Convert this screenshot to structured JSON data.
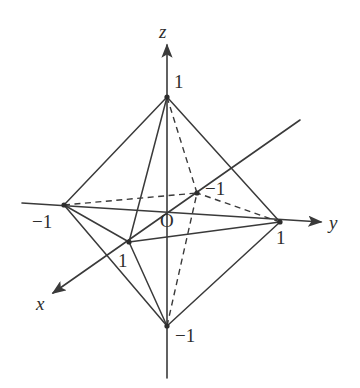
{
  "figure": {
    "background_color": "#ffffff",
    "line_color": "#3a3a3a",
    "text_color": "#2d2d2d"
  },
  "axes": [
    {
      "key": "x",
      "label": "x",
      "label_x": 36,
      "label_y": 310,
      "start_x": 300,
      "start_y": 120,
      "end_x": 53,
      "end_y": 293,
      "arrow": "end",
      "orientation": "diagonal-toward-viewer"
    },
    {
      "key": "y",
      "label": "y",
      "label_x": 329,
      "label_y": 229,
      "start_x": 22,
      "start_y": 203,
      "end_x": 321,
      "end_y": 222,
      "arrow": "end",
      "orientation": "horizontal-right"
    },
    {
      "key": "z",
      "label": "z",
      "label_x": 159,
      "label_y": 38,
      "start_x": 167,
      "start_y": 378,
      "end_x": 167,
      "end_y": 45,
      "arrow": "end",
      "orientation": "vertical-up"
    }
  ],
  "origin": {
    "label": "O",
    "x": 167,
    "y": 214,
    "label_x": 160,
    "label_y": 227
  },
  "vertices": [
    {
      "name": "z-positive",
      "label": "1",
      "axis": "z",
      "value": 1,
      "x": 167,
      "y": 97,
      "label_x": 174,
      "label_y": 88
    },
    {
      "name": "z-negative",
      "label": "−1",
      "axis": "z",
      "value": -1,
      "x": 167,
      "y": 326,
      "label_x": 175,
      "label_y": 342
    },
    {
      "name": "y-positive",
      "label": "1",
      "axis": "y",
      "value": 1,
      "x": 280,
      "y": 222,
      "label_x": 276,
      "label_y": 244
    },
    {
      "name": "y-negative",
      "label": "−1",
      "axis": "y",
      "value": -1,
      "x": 64,
      "y": 205,
      "label_x": 32,
      "label_y": 228
    },
    {
      "name": "x-positive",
      "label": "1",
      "axis": "x",
      "value": 1,
      "x": 129,
      "y": 242,
      "label_x": 118,
      "label_y": 267
    },
    {
      "name": "x-negative",
      "label": "−1",
      "axis": "x",
      "value": -1,
      "x": 197,
      "y": 193,
      "label_x": 205,
      "label_y": 195
    }
  ],
  "edges_solid": [
    {
      "from": "z-positive",
      "to": "y-negative"
    },
    {
      "from": "z-positive",
      "to": "y-positive"
    },
    {
      "from": "z-positive",
      "to": "x-positive"
    },
    {
      "from": "z-negative",
      "to": "y-negative"
    },
    {
      "from": "z-negative",
      "to": "y-positive"
    },
    {
      "from": "z-negative",
      "to": "x-positive"
    },
    {
      "from": "y-negative",
      "to": "x-positive"
    },
    {
      "from": "x-positive",
      "to": "y-positive"
    }
  ],
  "edges_dashed": [
    {
      "from": "z-positive",
      "to": "x-negative"
    },
    {
      "from": "z-negative",
      "to": "x-negative"
    },
    {
      "from": "y-negative",
      "to": "x-negative"
    },
    {
      "from": "y-positive",
      "to": "x-negative"
    }
  ],
  "chart_data": {
    "type": "diagram",
    "subtype": "3d-wireframe-octahedron",
    "axis_names": [
      "x",
      "y",
      "z"
    ],
    "origin_label": "O",
    "vertex_coordinates_3d": [
      {
        "label": "1",
        "coords": [
          0,
          0,
          1
        ]
      },
      {
        "label": "-1",
        "coords": [
          0,
          0,
          -1
        ]
      },
      {
        "label": "1",
        "coords": [
          0,
          1,
          0
        ]
      },
      {
        "label": "-1",
        "coords": [
          0,
          -1,
          0
        ]
      },
      {
        "label": "1",
        "coords": [
          1,
          0,
          0
        ]
      },
      {
        "label": "-1",
        "coords": [
          -1,
          0,
          0
        ]
      }
    ],
    "edge_count": 12,
    "hidden_edge_count": 4,
    "visible_edge_count": 8,
    "tick_labels": [
      "1",
      "-1",
      "1",
      "-1",
      "1",
      "-1"
    ]
  }
}
